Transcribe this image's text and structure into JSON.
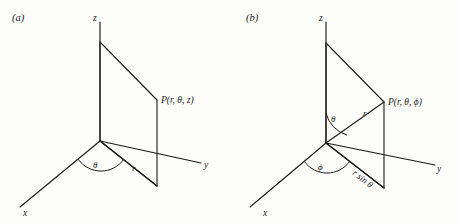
{
  "figure": {
    "background_color": "#fdfdfb",
    "ink_color": "#1a1a1a",
    "panels": [
      {
        "tag": "(a)",
        "name": "cylindrical-coordinates",
        "axes": [
          {
            "name": "z",
            "label": "z"
          },
          {
            "name": "y",
            "label": "y"
          },
          {
            "name": "x",
            "label": "x"
          }
        ],
        "point_label": "P(r, θ, z)",
        "angle_labels": [
          {
            "name": "theta",
            "label": "θ"
          }
        ],
        "segment_labels": [
          {
            "name": "r",
            "label": "r"
          }
        ]
      },
      {
        "tag": "(b)",
        "name": "spherical-coordinates",
        "axes": [
          {
            "name": "z",
            "label": "z"
          },
          {
            "name": "y",
            "label": "y"
          },
          {
            "name": "x",
            "label": "x"
          }
        ],
        "point_label": "P(r, θ, ϕ)",
        "angle_labels": [
          {
            "name": "theta",
            "label": "θ"
          },
          {
            "name": "phi",
            "label": "ϕ"
          }
        ],
        "segment_labels": [
          {
            "name": "r",
            "label": "r"
          },
          {
            "name": "r-sin-theta",
            "label": "r sin θ"
          }
        ]
      }
    ]
  }
}
